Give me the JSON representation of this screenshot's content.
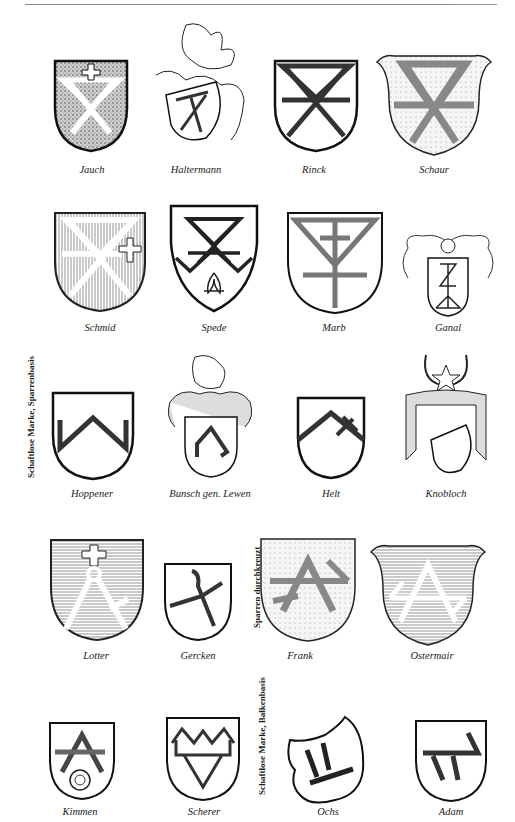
{
  "page": {
    "header": {
      "running_head": ""
    },
    "rows": [
      {
        "items": [
          {
            "name": "Jauch",
            "style": "stippled-dark",
            "charge": "crossed keys with cross"
          },
          {
            "name": "Haltermann",
            "style": "crested-helm",
            "charge": "mark on tilted shield"
          },
          {
            "name": "Rinck",
            "style": "plain",
            "charge": "saltire mark"
          },
          {
            "name": "Schaur",
            "style": "stippled",
            "charge": "saltire mark hatched"
          }
        ]
      },
      {
        "items": [
          {
            "name": "Schmid",
            "style": "vertical-hatch",
            "charge": "crossed mark with cross"
          },
          {
            "name": "Spede",
            "style": "plain-pointed",
            "charge": "mark with fleur-de-lis"
          },
          {
            "name": "Marb",
            "style": "plain",
            "charge": "cross-staff mark"
          },
          {
            "name": "Ganal",
            "style": "crested-helm",
            "charge": "house mark"
          }
        ]
      },
      {
        "side_label": "Schaftlose Marke, Sparrenbasis",
        "items": [
          {
            "name": "Hoppener",
            "style": "plain",
            "charge": "chevron"
          },
          {
            "name": "Bunsch gen. Lewen",
            "style": "crested-helm",
            "charge": "chevron"
          },
          {
            "name": "Helt",
            "style": "plain",
            "charge": "chevron with cross"
          },
          {
            "name": "Knobloch",
            "style": "crested-helm",
            "charge": "chevron with star"
          }
        ]
      },
      {
        "side_label": "Sparren durchkreuzt",
        "items": [
          {
            "name": "Lotter",
            "style": "horizontal-hatch",
            "charge": "compass with cross"
          },
          {
            "name": "Gercken",
            "style": "plain",
            "charge": "crossed mark"
          },
          {
            "name": "Frank",
            "style": "stippled",
            "charge": "crossed chevron"
          },
          {
            "name": "Ostermair",
            "style": "horizontal-hatch",
            "charge": "crossed chevron"
          }
        ]
      },
      {
        "side_label": "Schaftlose Marke, Balkenbasis",
        "items": [
          {
            "name": "Kimmen",
            "style": "plain",
            "charge": "chevron with rose"
          },
          {
            "name": "Scherer",
            "style": "plain",
            "charge": "mark with shears"
          },
          {
            "name": "Ochs",
            "style": "tilted-shield",
            "charge": "beam mark"
          },
          {
            "name": "Adam",
            "style": "plain",
            "charge": "beam mark"
          }
        ]
      }
    ]
  }
}
